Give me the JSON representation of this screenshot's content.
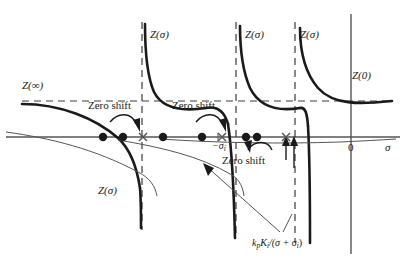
{
  "figure": {
    "type": "diagram",
    "background": "#ffffff",
    "ink_color": "#1a1a1a",
    "thin_color": "#555555",
    "dashed_color": "#3a3a3a"
  },
  "axes": {
    "horizontal_label": "σ",
    "origin_label": "0",
    "x_axis_y": 137,
    "y_axis_x": 351
  },
  "labels": {
    "z_infinity": "Z(∞)",
    "z_zero": "Z(0)",
    "z_sigma_1": "Z(σ)",
    "z_sigma_2": "Z(σ)",
    "z_sigma_3": "Z(σ)",
    "z_sigma_lower": "Z(σ)",
    "zero_shift_1": "Zero shift",
    "zero_shift_2": "Zero shift",
    "zero_shift_3": "Zero shift",
    "sigma_i_neg": "−σ",
    "sigma_i_neg_sub": "i",
    "formula_main": "/(σ + σ",
    "formula_kp": "k",
    "formula_kp_sub": "p",
    "formula_ki": "K",
    "formula_ki_sub": "i",
    "formula_tail_sub": "i",
    "formula_close": ")"
  },
  "asymptotes": [
    {
      "name": "asymptote-1",
      "x": 142
    },
    {
      "name": "asymptote-2",
      "x": 236
    },
    {
      "name": "asymptote-3",
      "x": 295
    }
  ],
  "horizontal_dashed_y": 101,
  "poles": [
    {
      "name": "pole-1",
      "x": 103,
      "y": 137
    },
    {
      "name": "pole-2",
      "x": 123,
      "y": 137
    },
    {
      "name": "pole-3",
      "x": 163,
      "y": 137
    },
    {
      "name": "pole-4",
      "x": 202,
      "y": 137
    },
    {
      "name": "pole-5",
      "x": 246,
      "y": 137
    },
    {
      "name": "pole-6",
      "x": 257,
      "y": 137
    }
  ],
  "zeros": [
    {
      "name": "zero-1",
      "x": 143,
      "y": 137
    },
    {
      "name": "zero-2",
      "x": 222,
      "y": 137
    },
    {
      "name": "zero-3",
      "x": 286,
      "y": 137
    }
  ]
}
